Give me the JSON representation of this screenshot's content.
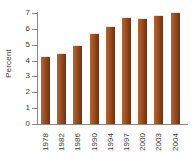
{
  "chart_data": {
    "type": "bar",
    "title": "",
    "xlabel": "",
    "ylabel": "Percent",
    "categories": [
      "1978",
      "1982",
      "1986",
      "1990",
      "1994",
      "1997",
      "2000",
      "2003",
      "2004"
    ],
    "values": [
      4.2,
      4.4,
      4.9,
      5.7,
      6.1,
      6.7,
      6.65,
      6.8,
      7.0
    ],
    "ylim": [
      0,
      7
    ],
    "yticks": [
      0,
      1,
      2,
      3,
      4,
      5,
      6,
      7
    ],
    "ytick_labels": [
      "0",
      "1",
      "2",
      "3",
      "4",
      "5",
      "6",
      "7"
    ],
    "grid": false,
    "legend": null,
    "bar_color": "#9e5124",
    "axis_color": "#8a8a8a",
    "background_color": "#ffffff"
  }
}
